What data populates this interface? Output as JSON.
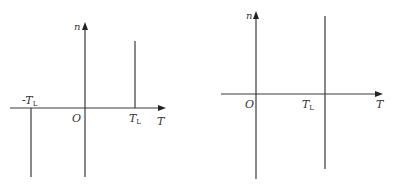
{
  "colors": {
    "line": "#3a3a3a",
    "text": "#333333",
    "background": "#ffffff"
  },
  "left_diagram": {
    "y_axis_label": "n",
    "x_axis_label": "T",
    "origin_label": "O",
    "neg_marker_label": "-T",
    "neg_marker_sub": "L",
    "pos_marker_label": "T",
    "pos_marker_sub": "L"
  },
  "right_diagram": {
    "y_axis_label": "n",
    "x_axis_label": "T",
    "origin_label": "O",
    "pos_marker_label": "T",
    "pos_marker_sub": "L"
  }
}
